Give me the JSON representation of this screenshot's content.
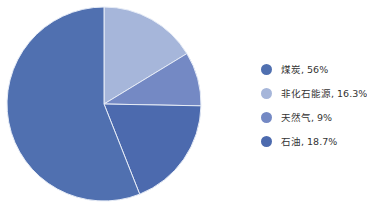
{
  "chart_data": {
    "type": "pie",
    "title": "",
    "categories": [
      "煤炭",
      "非化石能源",
      "天然气",
      "石油"
    ],
    "values": [
      56,
      16.3,
      9,
      18.7
    ],
    "unit": "%",
    "colors": [
      "#5070b0",
      "#a6b6da",
      "#7489c4",
      "#4c6aae"
    ],
    "draw_order": [
      1,
      2,
      3,
      0
    ],
    "start_angle_deg": 0,
    "direction": "clockwise",
    "legend_position": "right",
    "grid": false
  },
  "legend": {
    "items": [
      {
        "label": "煤炭, 56%",
        "color": "#5070b0"
      },
      {
        "label": "非化石能源, 16.3%",
        "color": "#a6b6da"
      },
      {
        "label": "天然气, 9%",
        "color": "#7489c4"
      },
      {
        "label": "石油, 18.7%",
        "color": "#4c6aae"
      }
    ]
  }
}
